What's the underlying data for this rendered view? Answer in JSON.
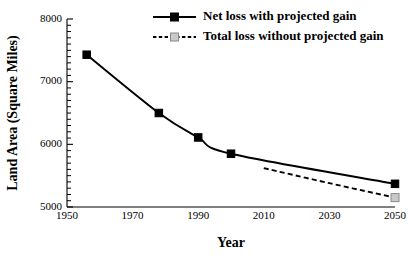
{
  "chart_data": {
    "type": "line",
    "title": "",
    "xlabel": "Year",
    "ylabel": "Land Area (Square Miles)",
    "xlim": [
      1950,
      2050
    ],
    "ylim": [
      5000,
      8000
    ],
    "grid": false,
    "legend_position": "top-right",
    "x_ticks": [
      "1950",
      "1970",
      "1990",
      "2010",
      "2030",
      "2050"
    ],
    "x_tick_values": [
      1950,
      1970,
      1990,
      2010,
      2030,
      2050
    ],
    "y_ticks": [
      "5000",
      "6000",
      "7000",
      "8000"
    ],
    "y_tick_values": [
      5000,
      6000,
      7000,
      8000
    ],
    "y_minor_step": 100,
    "series": [
      {
        "name": "Net loss with projected gain",
        "style": "solid",
        "marker": "filled-square",
        "color": "#000000",
        "x": [
          1956,
          1978,
          1990,
          2000,
          2050
        ],
        "values": [
          7430,
          6500,
          6110,
          5850,
          5370
        ]
      },
      {
        "name": "Total loss without projected gain",
        "style": "dashed",
        "marker": "open-square",
        "color": "#c9c9c9",
        "x": [
          2010,
          2030,
          2050
        ],
        "values": [
          5620,
          5380,
          5150
        ]
      }
    ]
  },
  "legend": {
    "entries": [
      {
        "label": "Net loss with projected gain"
      },
      {
        "label": "Total loss without projected gain"
      }
    ]
  },
  "axes": {
    "x_title": "Year",
    "y_title": "Land Area (Square Miles)"
  }
}
